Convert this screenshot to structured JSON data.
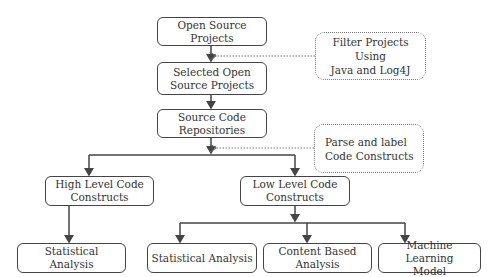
{
  "diagram": {
    "type": "flowchart",
    "nodes": {
      "open_source": "Open Source Projects",
      "selected": "Selected Open\nSource Projects",
      "repos": "Source Code\nRepositories",
      "high_level": "High Level Code\nConstructs",
      "low_level": "Low Level Code\nConstructs",
      "stat_high": "Statistical Analysis",
      "stat_low": "Statistical Analysis",
      "content": "Content Based\nAnalysis",
      "ml": "Machine Learning\nModel"
    },
    "annotations": {
      "filter": "Filter Projects Using\nJava and Log4J",
      "parse": "Parse  and label\nCode Constructs"
    },
    "edges": [
      [
        "open_source",
        "selected"
      ],
      [
        "selected",
        "repos"
      ],
      [
        "repos",
        "high_level"
      ],
      [
        "repos",
        "low_level"
      ],
      [
        "high_level",
        "stat_high"
      ],
      [
        "low_level",
        "stat_low"
      ],
      [
        "low_level",
        "content"
      ],
      [
        "low_level",
        "ml"
      ]
    ],
    "annotation_edges": [
      [
        "filter",
        "open_source->selected"
      ],
      [
        "parse",
        "repos->branch"
      ]
    ]
  }
}
